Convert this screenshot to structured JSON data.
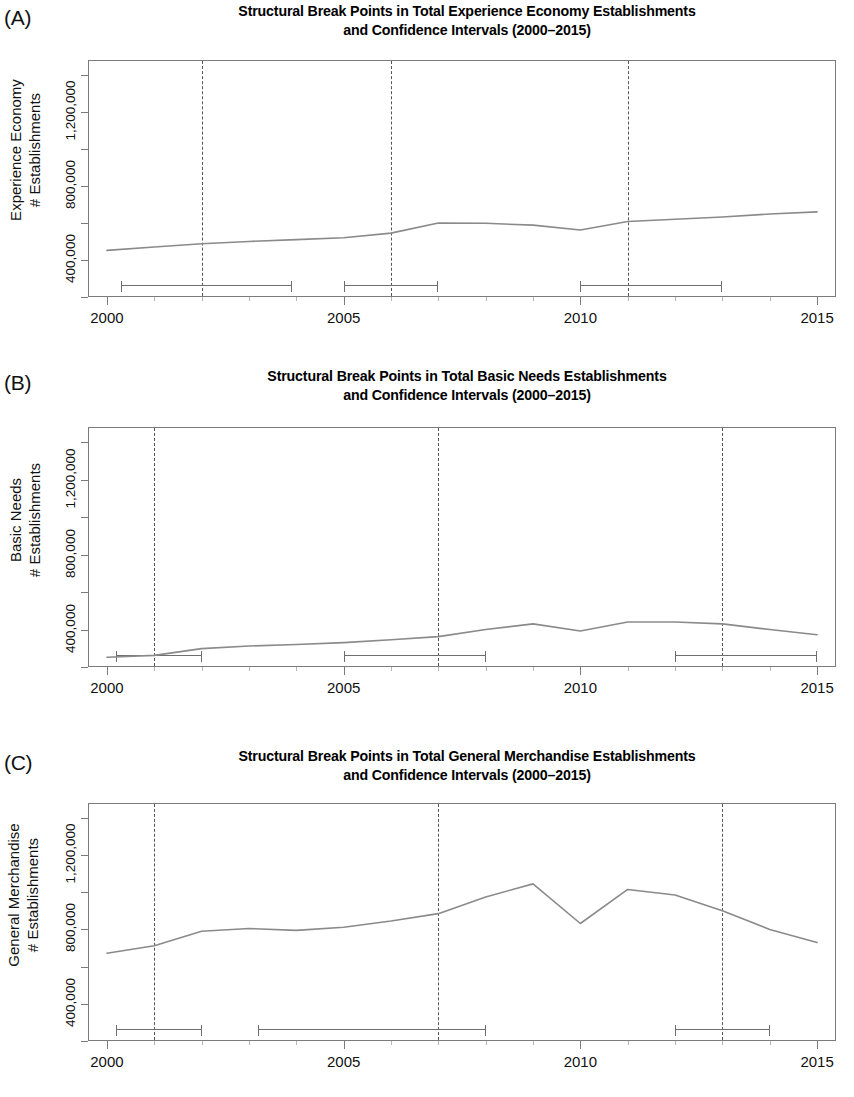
{
  "figure": {
    "width": 854,
    "height": 1097,
    "line_color": "#8a8a8a",
    "axis_color": "#7b7b7b",
    "breakline_color": "#555555"
  },
  "panels": [
    {
      "letter": "(A)",
      "title_line1": "Structural Break Points in Total Experience Economy Establishments",
      "title_line2": "and Confidence Intervals (2000–2015)",
      "ylabel_line1": "Experience Economy",
      "ylabel_line2": "# Establishments"
    },
    {
      "letter": "(B)",
      "title_line1": "Structural Break Points in Total Basic Needs Establishments",
      "title_line2": "and Confidence Intervals (2000–2015)",
      "ylabel_line1": "Basic Needs",
      "ylabel_line2": "# Establishments"
    },
    {
      "letter": "(C)",
      "title_line1": "Structural Break Points in Total General Merchandise Establishments",
      "title_line2": "and Confidence Intervals (2000–2015)",
      "ylabel_line1": "General Merchandise",
      "ylabel_line2": "# Establishments"
    }
  ],
  "axes": {
    "x_tick_labels": [
      "2000",
      "2005",
      "2010",
      "2015"
    ],
    "x_tick_values": [
      2000,
      2005,
      2010,
      2015
    ],
    "x_minor_ticks": [
      2000,
      2001,
      2002,
      2003,
      2004,
      2005,
      2006,
      2007,
      2008,
      2009,
      2010,
      2011,
      2012,
      2013,
      2014,
      2015
    ],
    "y_tick_labels": [
      "400,000",
      "800,000",
      "1,200,000"
    ],
    "y_tick_values": [
      400000,
      800000,
      1200000
    ],
    "y_minor_tick_values": [
      200000,
      400000,
      600000,
      800000,
      1000000,
      1200000,
      1400000
    ],
    "xlim": [
      1999.6,
      2015.4
    ],
    "ylim": [
      200000,
      1480000
    ]
  },
  "chart_data": [
    {
      "type": "line",
      "panel": "(A)",
      "title": "Structural Break Points in Total Experience Economy Establishments and Confidence Intervals (2000–2015)",
      "xlabel": "",
      "ylabel": "Experience Economy # Establishments",
      "xlim": [
        1999.6,
        2015.4
      ],
      "ylim": [
        200000,
        1480000
      ],
      "grid": false,
      "legend": "none",
      "x": [
        2000,
        2001,
        2002,
        2003,
        2004,
        2005,
        2006,
        2007,
        2008,
        2009,
        2010,
        2011,
        2012,
        2013,
        2014,
        2015
      ],
      "values": [
        452000,
        470000,
        488000,
        500000,
        510000,
        520000,
        545000,
        600000,
        598000,
        588000,
        562000,
        608000,
        620000,
        632000,
        648000,
        660000
      ],
      "breakpoints": [
        2002,
        2006,
        2011
      ],
      "confidence_intervals": [
        {
          "breakpoint": 2002,
          "lower": 2000.3,
          "upper": 2003.9
        },
        {
          "breakpoint": 2006,
          "lower": 2005.0,
          "upper": 2007.0
        },
        {
          "breakpoint": 2011,
          "lower": 2010.0,
          "upper": 2013.0
        }
      ]
    },
    {
      "type": "line",
      "panel": "(B)",
      "title": "Structural Break Points in Total Basic Needs Establishments and Confidence Intervals (2000–2015)",
      "xlabel": "",
      "ylabel": "Basic Needs # Establishments",
      "xlim": [
        1999.6,
        2015.4
      ],
      "ylim": [
        200000,
        1480000
      ],
      "grid": false,
      "legend": "none",
      "x": [
        2000,
        2001,
        2002,
        2003,
        2004,
        2005,
        2006,
        2007,
        2008,
        2009,
        2010,
        2011,
        2012,
        2013,
        2014,
        2015
      ],
      "values": [
        252000,
        262000,
        298000,
        312000,
        320000,
        330000,
        345000,
        362000,
        400000,
        430000,
        392000,
        440000,
        440000,
        430000,
        400000,
        372000
      ],
      "breakpoints": [
        2001,
        2007,
        2013
      ],
      "confidence_intervals": [
        {
          "breakpoint": 2001,
          "lower": 2000.2,
          "upper": 2002.0
        },
        {
          "breakpoint": 2007,
          "lower": 2005.0,
          "upper": 2008.0
        },
        {
          "breakpoint": 2013,
          "lower": 2012.0,
          "upper": 2015.0
        }
      ]
    },
    {
      "type": "line",
      "panel": "(C)",
      "title": "Structural Break Points in Total General Merchandise Establishments and Confidence Intervals (2000–2015)",
      "xlabel": "",
      "ylabel": "General Merchandise # Establishments",
      "xlim": [
        1999.6,
        2015.4
      ],
      "ylim": [
        200000,
        1480000
      ],
      "grid": false,
      "legend": "none",
      "x": [
        2000,
        2001,
        2002,
        2003,
        2004,
        2005,
        2006,
        2007,
        2008,
        2009,
        2010,
        2011,
        2012,
        2013,
        2014,
        2015
      ],
      "values": [
        672000,
        712000,
        790000,
        805000,
        795000,
        812000,
        845000,
        885000,
        975000,
        1045000,
        832000,
        1015000,
        985000,
        900000,
        800000,
        730000
      ],
      "breakpoints": [
        2001,
        2007,
        2013
      ],
      "confidence_intervals": [
        {
          "breakpoint": 2001,
          "lower": 2000.2,
          "upper": 2002.0
        },
        {
          "breakpoint": 2007,
          "lower": 2003.2,
          "upper": 2008.0
        },
        {
          "breakpoint": 2013,
          "lower": 2012.0,
          "upper": 2014.0
        }
      ]
    }
  ]
}
